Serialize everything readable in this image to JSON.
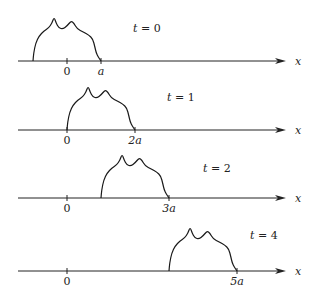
{
  "diagram": {
    "axis_label": "x",
    "unit_symbol": "a",
    "panels": [
      {
        "time_label": "t = 0",
        "t": 0,
        "pulse_start_units": -1,
        "pulse_end_units": 1,
        "ticks": [
          {
            "pos_units": 0,
            "label": "0"
          },
          {
            "pos_units": 1,
            "label": "a"
          }
        ]
      },
      {
        "time_label": "t = 1",
        "t": 1,
        "pulse_start_units": 0,
        "pulse_end_units": 2,
        "ticks": [
          {
            "pos_units": 0,
            "label": "0"
          },
          {
            "pos_units": 2,
            "label": "2a"
          }
        ]
      },
      {
        "time_label": "t = 2",
        "t": 2,
        "pulse_start_units": 1,
        "pulse_end_units": 3,
        "ticks": [
          {
            "pos_units": 0,
            "label": "0"
          },
          {
            "pos_units": 3,
            "label": "3a"
          }
        ]
      },
      {
        "time_label": "t = 4",
        "t": 4,
        "pulse_start_units": 3,
        "pulse_end_units": 5,
        "ticks": [
          {
            "pos_units": 0,
            "label": "0"
          },
          {
            "pos_units": 5,
            "label": "5a"
          }
        ]
      }
    ]
  }
}
